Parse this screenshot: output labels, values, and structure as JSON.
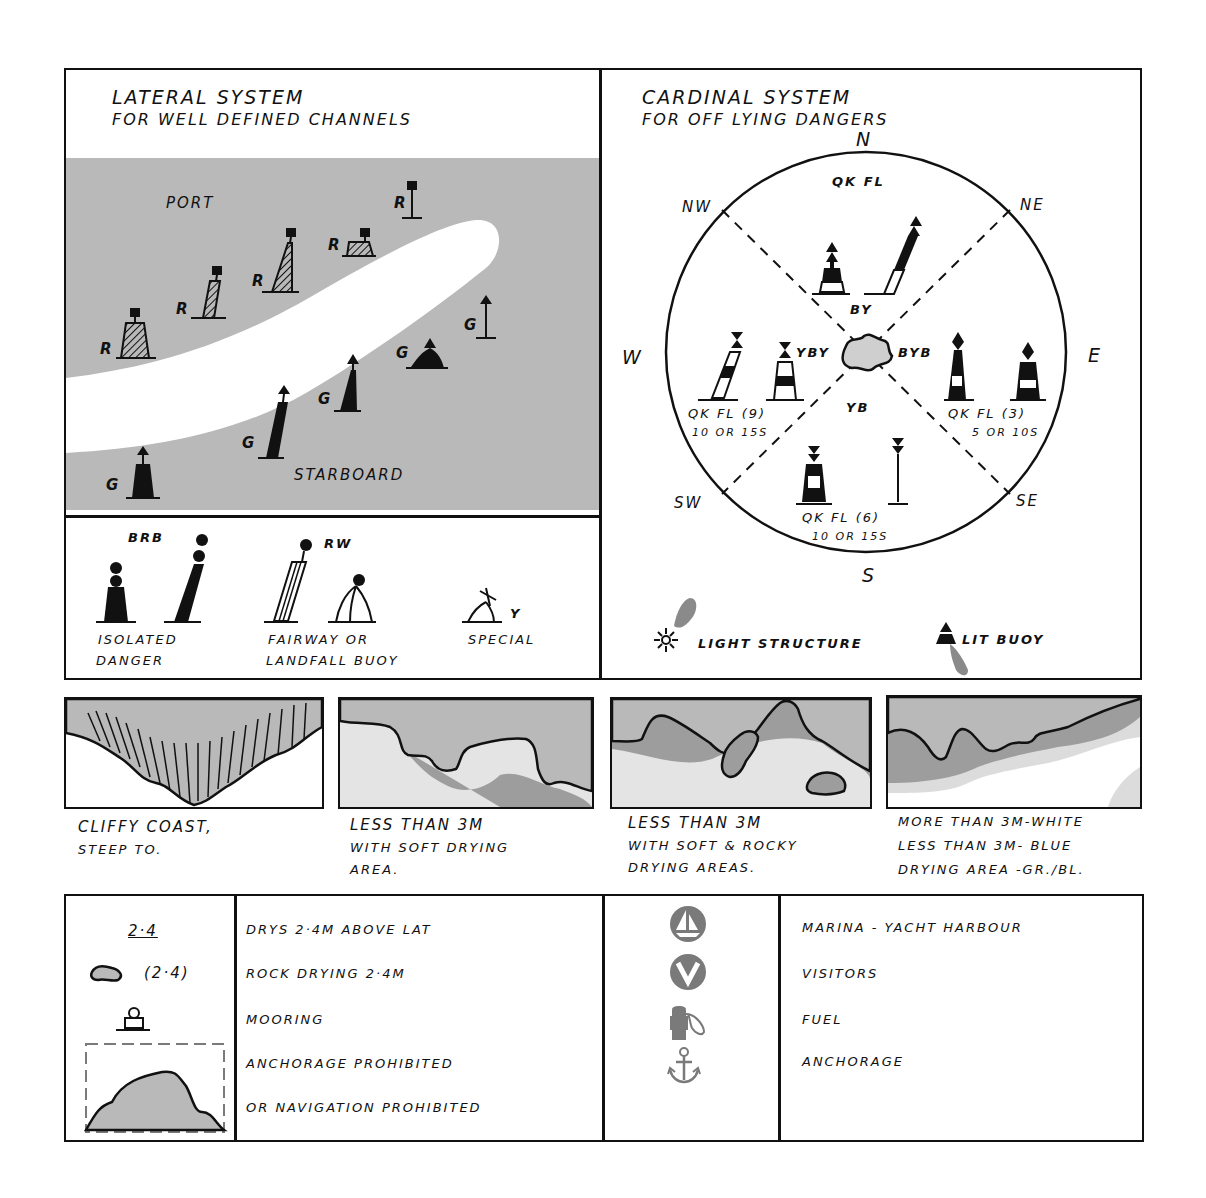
{
  "colors": {
    "ink": "#111111",
    "sea_grey": "#b9b9b9",
    "shoal_grey": "#9d9d9d",
    "light_grey": "#dcdcdc",
    "paper": "#ffffff",
    "symbol_grey": "#7a7a7a"
  },
  "lateral": {
    "title": "LATERAL SYSTEM",
    "subtitle": "FOR WELL DEFINED CHANNELS",
    "port_label": "PORT",
    "starboard_label": "STARBOARD",
    "port_buoys": [
      {
        "letter": "R",
        "shape": "can"
      },
      {
        "letter": "R",
        "shape": "spar-pillar"
      },
      {
        "letter": "R",
        "shape": "pillar-tall"
      },
      {
        "letter": "R",
        "shape": "can-low"
      },
      {
        "letter": "R",
        "shape": "spar"
      }
    ],
    "starboard_buoys": [
      {
        "letter": "G",
        "shape": "conical"
      },
      {
        "letter": "G",
        "shape": "spar-pillar"
      },
      {
        "letter": "G",
        "shape": "pillar"
      },
      {
        "letter": "G",
        "shape": "conical-low"
      },
      {
        "letter": "G",
        "shape": "spar"
      }
    ]
  },
  "other_marks": {
    "isolated": {
      "code": "BRB",
      "label_line1": "ISOLATED",
      "label_line2": "DANGER"
    },
    "fairway": {
      "code": "RW",
      "label_line1": "FAIRWAY OR",
      "label_line2": "LANDFALL BUOY"
    },
    "special": {
      "code": "Y",
      "label": "SPECIAL"
    }
  },
  "cardinal": {
    "title": "CARDINAL SYSTEM",
    "subtitle": "FOR OFF LYING DANGERS",
    "directions": {
      "n": "N",
      "ne": "NE",
      "e": "E",
      "se": "SE",
      "s": "S",
      "sw": "SW",
      "w": "W",
      "nw": "NW"
    },
    "north": {
      "colour": "BY",
      "light": "QK FL"
    },
    "east": {
      "colour": "BYB",
      "light": "QK FL (3)",
      "period": "5 OR 10S"
    },
    "south": {
      "colour": "YB",
      "light": "QK FL (6)",
      "period": "10 OR 15S"
    },
    "west": {
      "colour": "YBY",
      "light": "QK FL (9)",
      "period": "10 OR 15S"
    },
    "legend_light_structure": "LIGHT STRUCTURE",
    "legend_lit_buoy": "LIT BUOY"
  },
  "coast_panels": [
    {
      "line1": "CLIFFY COAST,",
      "line2": "STEEP TO.",
      "line3": ""
    },
    {
      "line1": "LESS THAN 3M",
      "line2": "WITH SOFT DRYING",
      "line3": "AREA."
    },
    {
      "line1": "LESS THAN 3M",
      "line2": "WITH SOFT & ROCKY",
      "line3": "DRYING AREAS."
    },
    {
      "line1": "MORE THAN 3M-WHITE",
      "line2": "LESS THAN 3M- BLUE",
      "line3": "DRYING AREA -GR./BL."
    }
  ],
  "legend_left": {
    "symbols": {
      "drying_height": "2·4",
      "rock_drying": "(2·4)"
    },
    "items": [
      "DRYS 2·4M ABOVE LAT",
      "ROCK DRYING 2·4M",
      "MOORING",
      "ANCHORAGE PROHIBITED",
      "OR NAVIGATION PROHIBITED"
    ]
  },
  "legend_right": {
    "items": [
      {
        "icon": "marina-icon",
        "label": "MARINA - YACHT HARBOUR"
      },
      {
        "icon": "visitors-icon",
        "label": "VISITORS"
      },
      {
        "icon": "fuel-icon",
        "label": "FUEL"
      },
      {
        "icon": "anchor-icon",
        "label": "ANCHORAGE"
      }
    ]
  }
}
